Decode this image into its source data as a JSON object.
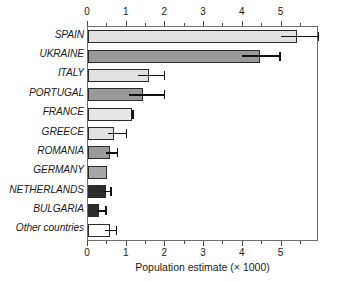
{
  "chart_data": {
    "type": "bar",
    "orientation": "horizontal",
    "title": "",
    "xlabel": "Population estimate (× 1000)",
    "ylabel": "",
    "xlim": [
      0,
      5.97
    ],
    "xticks": [
      0,
      1,
      2,
      3,
      4,
      5
    ],
    "xticklabels": [
      "0",
      "1",
      "2",
      "3",
      "4",
      "5"
    ],
    "minor_tick_step": 0.5,
    "grid": false,
    "legend": null,
    "axis_top": true,
    "axis_bottom": true,
    "categories": [
      "SPAIN",
      "UKRAINE",
      "ITALY",
      "PORTUGAL",
      "FRANCE",
      "GREECE",
      "ROMANIA",
      "GERMANY",
      "NETHERLANDS",
      "BULGARIA",
      "Other countries"
    ],
    "values": [
      5.4,
      4.45,
      1.58,
      1.42,
      1.13,
      0.68,
      0.57,
      0.48,
      0.46,
      0.29,
      0.58
    ],
    "error_upper": [
      5.97,
      4.98,
      2.0,
      2.0,
      1.18,
      1.02,
      0.78,
      null,
      0.62,
      0.48,
      0.75
    ],
    "error_lower": [
      4.99,
      3.98,
      1.3,
      1.05,
      1.1,
      0.52,
      0.46,
      null,
      0.4,
      0.24,
      0.45
    ],
    "bar_colors": [
      "#e2e2e2",
      "#9a9a9a",
      "#e2e2e2",
      "#9a9a9a",
      "#e7e7e7",
      "#e2e2e2",
      "#9a9a9a",
      "#a8a8a8",
      "#2b2b2b",
      "#2b2b2b",
      "#ffffff"
    ],
    "bar_edge_color": "#2b2b2b",
    "error_bar_color": "#111111"
  }
}
